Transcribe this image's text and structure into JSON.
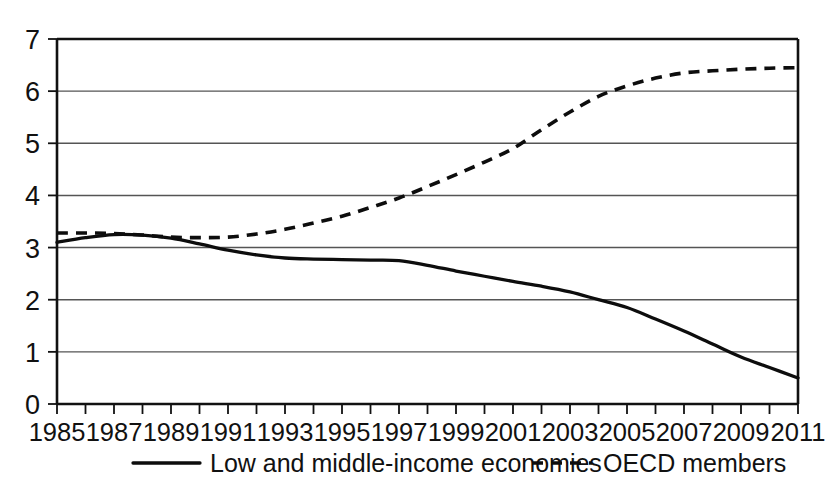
{
  "chart_data": {
    "type": "line",
    "title": "",
    "subtitle": "",
    "xlabel": "",
    "ylabel": "",
    "xlim": [
      1985,
      2011
    ],
    "ylim": [
      0,
      7
    ],
    "grid": true,
    "legend_position": "bottom",
    "x": [
      1985,
      1986,
      1987,
      1988,
      1989,
      1990,
      1991,
      1992,
      1993,
      1994,
      1995,
      1996,
      1997,
      1998,
      1999,
      2000,
      2001,
      2002,
      2003,
      2004,
      2005,
      2006,
      2007,
      2008,
      2009,
      2010,
      2011
    ],
    "y_ticks": [
      0,
      1,
      2,
      3,
      4,
      5,
      6,
      7
    ],
    "y_tick_labels": [
      "0",
      "1",
      "2",
      "3",
      "4",
      "5",
      "6",
      "7"
    ],
    "x_tick_labels": [
      "1985",
      "1987",
      "1989",
      "1991",
      "1993",
      "1995",
      "1997",
      "1999",
      "2001",
      "2003",
      "2005",
      "2007",
      "2009",
      "2011"
    ],
    "x_tick_label_years": [
      1985,
      1987,
      1989,
      1991,
      1993,
      1995,
      1997,
      1999,
      2001,
      2003,
      2005,
      2007,
      2009,
      2011
    ],
    "series": [
      {
        "name": "Low and middle-income economies",
        "style": "solid",
        "color": "#0d0d0d",
        "values": [
          3.1,
          3.19,
          3.25,
          3.24,
          3.18,
          3.07,
          2.95,
          2.86,
          2.8,
          2.78,
          2.77,
          2.76,
          2.75,
          2.66,
          2.55,
          2.45,
          2.35,
          2.26,
          2.15,
          2.0,
          1.85,
          1.63,
          1.4,
          1.15,
          0.9,
          0.7,
          0.5
        ]
      },
      {
        "name": "OECD members",
        "style": "dashed",
        "color": "#0d0d0d",
        "values": [
          3.28,
          3.28,
          3.27,
          3.24,
          3.2,
          3.19,
          3.2,
          3.26,
          3.35,
          3.47,
          3.6,
          3.77,
          3.95,
          4.17,
          4.4,
          4.64,
          4.9,
          5.26,
          5.6,
          5.9,
          6.1,
          6.25,
          6.35,
          6.39,
          6.42,
          6.44,
          6.45
        ]
      }
    ]
  },
  "legend": {
    "items": [
      {
        "label": "Low and middle-income economies",
        "style": "solid"
      },
      {
        "label": "OECD members",
        "style": "dashed"
      }
    ]
  }
}
